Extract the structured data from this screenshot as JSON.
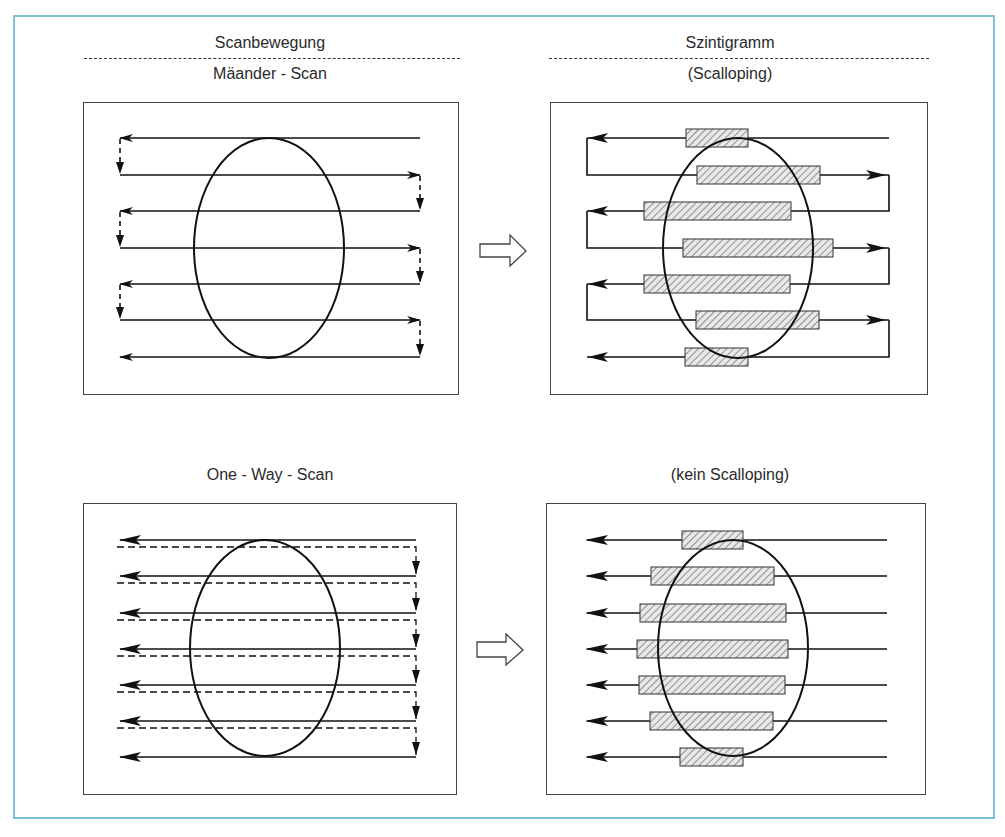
{
  "headers": {
    "left": "Scanbewegung",
    "right": "Szintigramm"
  },
  "panels": {
    "top_left": {
      "title": "Mäander - Scan"
    },
    "top_right": {
      "title": "(Scalloping)"
    },
    "bottom_left": {
      "title": "One - Way - Scan"
    },
    "bottom_right": {
      "title": "(kein Scalloping)"
    }
  },
  "icons": {
    "transition_top": "hollow-right-arrow-icon",
    "transition_bottom": "hollow-right-arrow-icon"
  },
  "colors": {
    "frame": "#7fc2d4",
    "line": "#1a1a1a",
    "hatch": "#555555"
  },
  "diagram": {
    "scan_lines": 7,
    "meander_bars": [
      {
        "x1": 686,
        "x2": 748,
        "y": 138
      },
      {
        "x1": 697,
        "x2": 820,
        "y": 175
      },
      {
        "x1": 644,
        "x2": 791,
        "y": 211
      },
      {
        "x1": 683,
        "x2": 833,
        "y": 248
      },
      {
        "x1": 644,
        "x2": 790,
        "y": 284
      },
      {
        "x1": 696,
        "x2": 819,
        "y": 320
      },
      {
        "x1": 685,
        "x2": 748,
        "y": 357
      }
    ],
    "oneway_bars": [
      {
        "x1": 682,
        "x2": 743,
        "y": 540
      },
      {
        "x1": 651,
        "x2": 774,
        "y": 576
      },
      {
        "x1": 640,
        "x2": 786,
        "y": 613
      },
      {
        "x1": 637,
        "x2": 788,
        "y": 649
      },
      {
        "x1": 639,
        "x2": 785,
        "y": 685
      },
      {
        "x1": 650,
        "x2": 773,
        "y": 721
      },
      {
        "x1": 680,
        "x2": 743,
        "y": 757
      }
    ]
  }
}
